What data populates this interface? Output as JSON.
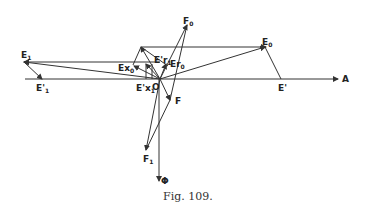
{
  "figure": {
    "caption": "Fig. 109.",
    "origin_label": "O",
    "axis_label": "A",
    "flux_label": "Φ"
  },
  "labels": {
    "E0": {
      "main": "E",
      "sub": "0"
    },
    "E1": {
      "main": "E",
      "sub": "1"
    },
    "E1p": {
      "main": "E'",
      "sub": "1"
    },
    "Ep": {
      "main": "E'",
      "sub": ""
    },
    "Ex0": {
      "main": "Ex",
      "sub": "0"
    },
    "Ex1p": {
      "main": "E'x",
      "sub": "1"
    },
    "Er1p": {
      "main": "E'r",
      "sub": "1"
    },
    "Er0": {
      "main": "Er",
      "sub": "0"
    },
    "F0": {
      "main": "F",
      "sub": "0"
    },
    "F": {
      "main": "F",
      "sub": ""
    },
    "F1": {
      "main": "F",
      "sub": "1"
    }
  },
  "colors": {
    "ink": "#333333",
    "background": "#ffffff"
  }
}
